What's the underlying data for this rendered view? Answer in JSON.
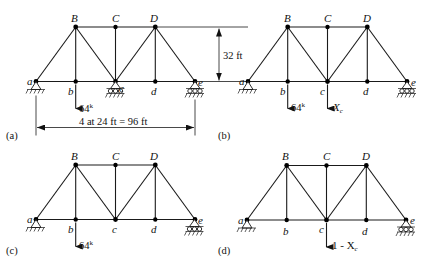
{
  "figure": {
    "panels": [
      {
        "id": "a",
        "caption": "(a)",
        "origin": [
          36,
          27
        ],
        "supports": {
          "a": "pin",
          "c": "roller",
          "e": "roller"
        },
        "loads": [
          {
            "node": "b",
            "label": "64",
            "unit": "k"
          }
        ],
        "dimensions": {
          "span": "4 at 24 ft = 96 ft",
          "height": "32 ft"
        }
      },
      {
        "id": "b",
        "caption": "(b)",
        "origin": [
          248,
          27
        ],
        "supports": {
          "a": "pin",
          "e": "roller"
        },
        "loads": [
          {
            "node": "b",
            "label": "64",
            "unit": "k"
          },
          {
            "node": "c",
            "label": "X",
            "sub": "c"
          }
        ]
      },
      {
        "id": "c",
        "caption": "(c)",
        "origin": [
          36,
          165
        ],
        "supports": {
          "a": "pin",
          "e": "roller"
        },
        "loads": [
          {
            "node": "b",
            "label": "64",
            "unit": "k"
          }
        ]
      },
      {
        "id": "d",
        "caption": "(d)",
        "origin": [
          247,
          165
        ],
        "supports": {
          "a": "pin",
          "e": "roller"
        },
        "loads": [
          {
            "node": "c",
            "label": "1 - X",
            "sub": "c"
          }
        ]
      }
    ],
    "node_labels": {
      "a": "a",
      "b": "b",
      "c": "c",
      "d": "d",
      "e": "e",
      "B": "B",
      "C": "C",
      "D": "D"
    },
    "labels": {
      "load_64": "64",
      "kip": "k",
      "xc_main": "X",
      "xc_sub": "c",
      "one_minus_xc_main": "1 - X",
      "one_minus_xc_sub": "c",
      "span_dim": "4 at 24 ft = 96 ft",
      "height_dim": "32 ft",
      "cap_a": "(a)",
      "cap_b": "(b)",
      "cap_c": "(c)",
      "cap_d": "(d)"
    },
    "geometry": {
      "panel_width_px": 39.7,
      "height_px": 54.5,
      "members": [
        "ab",
        "bc",
        "cd",
        "de",
        "BC",
        "CD",
        "aB",
        "Bb",
        "Bc",
        "Cc",
        "cD",
        "Dd",
        "De"
      ]
    }
  }
}
